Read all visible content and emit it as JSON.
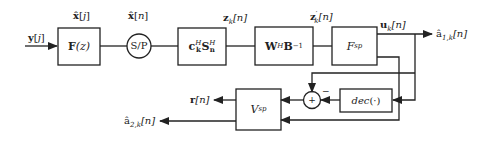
{
  "diagram": {
    "type": "signal-flow block diagram",
    "colors": {
      "stroke": "#222222",
      "background": "#ffffff"
    },
    "signals": {
      "input": "y[j]",
      "x_hat_j": "x̂[j]",
      "x_hat_n": "x̂[n]",
      "z_k": "z_k[n]",
      "z_k_prime": "z′_k[n]",
      "u_k": "u_k[n]",
      "a1_out": "â_1,k[n]",
      "r_out": "r[n]",
      "a2_out": "â_2,k[n]"
    },
    "blocks": {
      "filter": "F(z)",
      "sp": "S/P",
      "despread": "c_k^H S_n^H",
      "whiten": "W^H B^-1",
      "fsp": "F_sp",
      "dec": "dec(·)",
      "vsp": "V_sp",
      "sum": "+",
      "minus_sign": "−"
    },
    "display": {
      "input": [
        "y",
        "[",
        "j",
        "]"
      ],
      "x_hat_j": [
        "x̂",
        "[",
        "j",
        "]"
      ],
      "x_hat_n": [
        "x̂",
        "[",
        "n",
        "]"
      ],
      "z_k": [
        "z",
        "k",
        "[n]"
      ],
      "z_k_prime": [
        "z",
        "′",
        "k",
        "[n]"
      ],
      "u_k": [
        "u",
        "k",
        "[n]"
      ],
      "a1_out": [
        "â",
        "1,k",
        "[n]"
      ],
      "r_out": [
        "r",
        "[n]"
      ],
      "a2_out": [
        "â",
        "2,k",
        "[n]"
      ],
      "filter": [
        "F",
        "(z)"
      ],
      "despread": [
        "c",
        "H",
        "k",
        "S",
        "H",
        "n"
      ],
      "whiten": [
        "W",
        "H",
        " B",
        "−1"
      ],
      "fsp": [
        "F",
        "sp"
      ],
      "dec": [
        "dec",
        "(·)"
      ],
      "vsp": [
        "V",
        "sp"
      ]
    }
  }
}
